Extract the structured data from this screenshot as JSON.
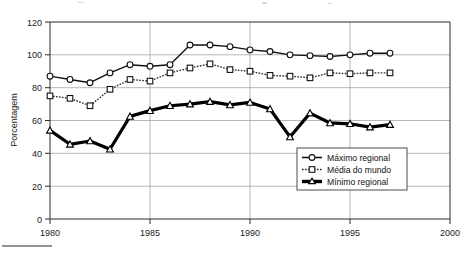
{
  "chart_data": {
    "type": "line",
    "title": "",
    "subtitle": "",
    "xlabel": "",
    "ylabel": "Porcentagem",
    "xlim": [
      1980,
      2000
    ],
    "ylim": [
      0,
      120
    ],
    "ytick_step": 20,
    "xtick_step": 5,
    "grid": "horizontal-and-vertical",
    "legend_position": "inside-lower-right",
    "x": [
      1980,
      1981,
      1982,
      1983,
      1984,
      1985,
      1986,
      1987,
      1988,
      1989,
      1990,
      1991,
      1992,
      1993,
      1994,
      1995,
      1996,
      1997
    ],
    "xticks": [
      "1980",
      "1985",
      "1990",
      "1995",
      "2000"
    ],
    "yticks": [
      "0",
      "20",
      "40",
      "60",
      "80",
      "100",
      "120"
    ],
    "series": [
      {
        "name": "Máximo regional",
        "marker": "open-circle",
        "line_style": "solid",
        "values": [
          87,
          85,
          83,
          89,
          94,
          93,
          94,
          106,
          106,
          105,
          103,
          102,
          100,
          99.5,
          99,
          100,
          101,
          101
        ]
      },
      {
        "name": "Média do mundo",
        "marker": "open-square",
        "line_style": "dotted",
        "values": [
          75,
          73.5,
          69,
          79,
          85,
          84,
          89,
          92,
          94.5,
          91,
          90,
          87.5,
          87,
          86,
          89,
          88.5,
          89,
          89
        ]
      },
      {
        "name": "Mínimo regional",
        "marker": "triangle",
        "line_style": "solid-bold",
        "values": [
          54,
          45.5,
          47.5,
          42.5,
          62.5,
          66,
          69,
          70,
          71.5,
          69.5,
          71,
          67,
          50,
          64.5,
          58.5,
          58,
          56,
          57.5
        ]
      }
    ],
    "legend": [
      {
        "label": "Máximo regional",
        "marker": "open-circle",
        "style": "solid"
      },
      {
        "label": "Média do mundo",
        "marker": "open-square",
        "style": "dotted"
      },
      {
        "label": "Mínimo regional",
        "marker": "triangle",
        "style": "solid-bold"
      }
    ]
  }
}
